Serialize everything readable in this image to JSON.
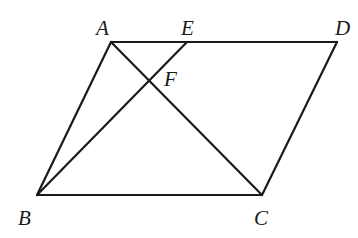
{
  "diagram": {
    "type": "geometry",
    "stroke_color": "#1a1a1a",
    "background": "#ffffff",
    "points": {
      "A": {
        "x": 111,
        "y": 42
      },
      "E": {
        "x": 187,
        "y": 42
      },
      "D": {
        "x": 337,
        "y": 42
      },
      "B": {
        "x": 37,
        "y": 195
      },
      "C": {
        "x": 262,
        "y": 195
      },
      "F": {
        "x": 149,
        "y": 81
      }
    },
    "labels": {
      "A": {
        "text": "A",
        "x": 96,
        "y": 35
      },
      "E": {
        "text": "E",
        "x": 181,
        "y": 35
      },
      "D": {
        "text": "D",
        "x": 335,
        "y": 35
      },
      "F": {
        "text": "F",
        "x": 164,
        "y": 86
      },
      "B": {
        "text": "B",
        "x": 18,
        "y": 225
      },
      "C": {
        "text": "C",
        "x": 254,
        "y": 225
      }
    },
    "segments": [
      {
        "name": "AD",
        "from": "A",
        "to": "D"
      },
      {
        "name": "AB",
        "from": "A",
        "to": "B"
      },
      {
        "name": "BC",
        "from": "B",
        "to": "C"
      },
      {
        "name": "CD",
        "from": "C",
        "to": "D"
      },
      {
        "name": "AC",
        "from": "A",
        "to": "C"
      },
      {
        "name": "BE",
        "from": "B",
        "to": "E"
      }
    ]
  }
}
